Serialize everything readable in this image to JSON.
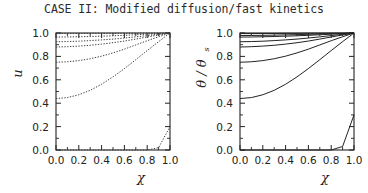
{
  "figure": {
    "title": "CASE II: Modified diffusion/fast kinetics",
    "background_color": "#ffffff",
    "ink_color": "#232323"
  },
  "chart_data": [
    {
      "panel": "left",
      "type": "line",
      "title": "",
      "xlabel": "χ",
      "ylabel": "u",
      "xlim": [
        0.0,
        1.0
      ],
      "ylim": [
        0.0,
        1.0
      ],
      "xticks": [
        0.0,
        0.2,
        0.4,
        0.6,
        0.8,
        1.0
      ],
      "yticks": [
        0.0,
        0.2,
        0.4,
        0.6,
        0.8,
        1.0
      ],
      "xtick_labels": [
        "0.0",
        "0.2",
        "0.4",
        "0.6",
        "0.8",
        "1.0"
      ],
      "ytick_labels": [
        "0.0",
        "0.2",
        "0.4",
        "0.6",
        "0.8",
        "1.0"
      ],
      "grid": false,
      "legend": "none",
      "line_style": "dotted",
      "line_color": "#3a3a3a",
      "x": [
        0.0,
        0.1,
        0.2,
        0.3,
        0.4,
        0.5,
        0.6,
        0.7,
        0.8,
        0.9,
        1.0
      ],
      "series": [
        {
          "name": "curve-1",
          "values": [
            0.995,
            0.995,
            0.996,
            0.996,
            0.997,
            0.997,
            0.998,
            0.998,
            0.999,
            0.999,
            1.0
          ]
        },
        {
          "name": "curve-2",
          "values": [
            0.965,
            0.966,
            0.968,
            0.97,
            0.973,
            0.976,
            0.98,
            0.985,
            0.99,
            0.995,
            1.0
          ]
        },
        {
          "name": "curve-3",
          "values": [
            0.925,
            0.927,
            0.93,
            0.935,
            0.941,
            0.948,
            0.957,
            0.967,
            0.978,
            0.989,
            1.0
          ]
        },
        {
          "name": "curve-4",
          "values": [
            0.88,
            0.883,
            0.888,
            0.895,
            0.905,
            0.917,
            0.931,
            0.948,
            0.966,
            0.983,
            1.0
          ]
        },
        {
          "name": "curve-5",
          "values": [
            0.75,
            0.754,
            0.764,
            0.78,
            0.802,
            0.83,
            0.862,
            0.898,
            0.934,
            0.968,
            1.0
          ]
        },
        {
          "name": "curve-6",
          "values": [
            0.44,
            0.448,
            0.472,
            0.51,
            0.562,
            0.625,
            0.696,
            0.772,
            0.85,
            0.926,
            1.0
          ]
        },
        {
          "name": "curve-7-corner",
          "values": [
            0.0,
            0.0,
            0.0,
            0.0,
            0.0,
            0.0,
            0.0,
            0.0,
            0.0,
            0.02,
            0.2
          ]
        }
      ]
    },
    {
      "panel": "right",
      "type": "line",
      "title": "",
      "xlabel": "χ",
      "ylabel": "θ / θ",
      "ylabel_subscript": "s",
      "xlim": [
        0.0,
        1.0
      ],
      "ylim": [
        0.0,
        1.0
      ],
      "xticks": [
        0.0,
        0.2,
        0.4,
        0.6,
        0.8,
        1.0
      ],
      "yticks": [
        0.0,
        0.2,
        0.4,
        0.6,
        0.8,
        1.0
      ],
      "xtick_labels": [
        "0.0",
        "0.2",
        "0.4",
        "0.6",
        "0.8",
        "1.0"
      ],
      "ytick_labels": [
        "0.0",
        "0.2",
        "0.4",
        "0.6",
        "0.8",
        "1.0"
      ],
      "grid": false,
      "legend": "none",
      "line_style": "solid",
      "line_color": "#232323",
      "x": [
        0.0,
        0.1,
        0.2,
        0.3,
        0.4,
        0.5,
        0.6,
        0.7,
        0.8,
        0.9,
        1.0
      ],
      "series": [
        {
          "name": "curve-1",
          "values": [
            0.995,
            0.995,
            0.996,
            0.996,
            0.997,
            0.997,
            0.998,
            0.998,
            0.999,
            0.999,
            1.0
          ]
        },
        {
          "name": "curve-2",
          "values": [
            0.978,
            0.979,
            0.98,
            0.982,
            0.984,
            0.986,
            0.989,
            0.992,
            0.995,
            0.997,
            1.0
          ]
        },
        {
          "name": "curve-3",
          "values": [
            0.965,
            0.966,
            0.968,
            0.97,
            0.973,
            0.976,
            0.98,
            0.985,
            0.99,
            0.995,
            1.0
          ]
        },
        {
          "name": "curve-4",
          "values": [
            0.925,
            0.927,
            0.93,
            0.935,
            0.941,
            0.948,
            0.957,
            0.967,
            0.978,
            0.989,
            1.0
          ]
        },
        {
          "name": "curve-5",
          "values": [
            0.88,
            0.883,
            0.888,
            0.895,
            0.905,
            0.917,
            0.931,
            0.948,
            0.966,
            0.983,
            1.0
          ]
        },
        {
          "name": "curve-6",
          "values": [
            0.75,
            0.754,
            0.764,
            0.78,
            0.802,
            0.83,
            0.862,
            0.898,
            0.934,
            0.968,
            1.0
          ]
        },
        {
          "name": "curve-7",
          "values": [
            0.44,
            0.448,
            0.472,
            0.51,
            0.562,
            0.625,
            0.696,
            0.772,
            0.85,
            0.926,
            1.0
          ]
        },
        {
          "name": "curve-8-corner",
          "values": [
            0.0,
            0.0,
            0.0,
            0.0,
            0.0,
            0.0,
            0.0,
            0.0,
            0.0,
            0.03,
            0.3
          ]
        }
      ]
    }
  ]
}
